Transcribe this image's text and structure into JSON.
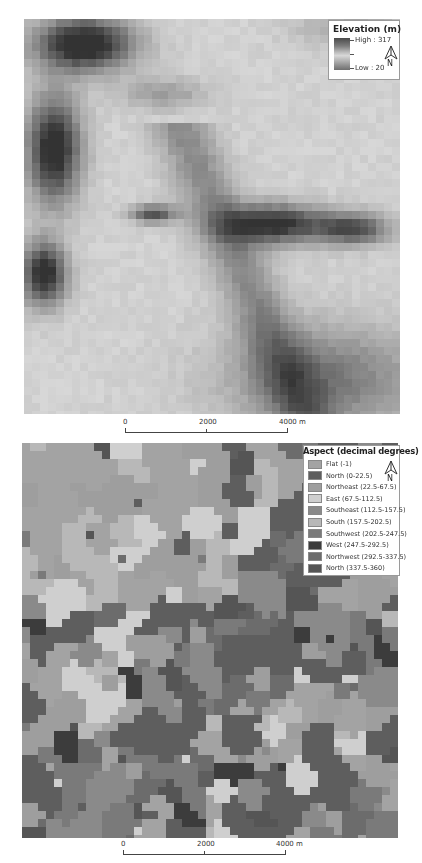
{
  "elevation_map": {
    "legend": {
      "title": "Elevation (m)",
      "high_label": "High : 317",
      "low_label": "Low : 20",
      "north_label": "N"
    },
    "scale_bar": {
      "labels": [
        "0",
        "2000",
        "4000 m"
      ]
    }
  },
  "aspect_map": {
    "legend": {
      "title": "Aspect (decimal degrees)",
      "north_label": "N",
      "classes": [
        {
          "label": "Flat (-1)",
          "color": "#a3a3a3"
        },
        {
          "label": "North (0-22.5)",
          "color": "#5e5e5e"
        },
        {
          "label": "Northeast (22.5-67.5)",
          "color": "#9e9e9e"
        },
        {
          "label": "East (67.5-112.5)",
          "color": "#cfcfcf"
        },
        {
          "label": "Southeast (112.5-157.5)",
          "color": "#8a8a8a"
        },
        {
          "label": "South (157.5-202.5)",
          "color": "#b8b8b8"
        },
        {
          "label": "Southwest (202.5-247.5)",
          "color": "#7a7a7a"
        },
        {
          "label": "West (247.5-292.5)",
          "color": "#3c3c3c"
        },
        {
          "label": "Northwest (292.5-337.5)",
          "color": "#6c6c6c"
        },
        {
          "label": "North (337.5-360)",
          "color": "#555555"
        }
      ]
    },
    "scale_bar": {
      "labels": [
        "0",
        "2000",
        "4000 m"
      ]
    }
  }
}
